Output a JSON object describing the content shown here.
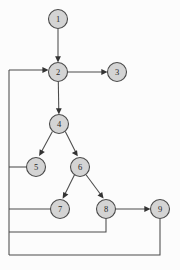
{
  "diagram": {
    "background_color": "#fcfcfc",
    "node_fill_color": "#d4d4d4",
    "node_stroke_color": "#4a4a4a",
    "edge_color": "#4a4a4a",
    "node_radius": 9.5,
    "nodes": [
      {
        "id": "1",
        "label": "1",
        "cx": 58,
        "cy": 19
      },
      {
        "id": "2",
        "label": "2",
        "cx": 58,
        "cy": 72
      },
      {
        "id": "3",
        "label": "3",
        "cx": 117,
        "cy": 72
      },
      {
        "id": "4",
        "label": "4",
        "cx": 59,
        "cy": 124
      },
      {
        "id": "5",
        "label": "5",
        "cx": 36,
        "cy": 167
      },
      {
        "id": "6",
        "label": "6",
        "cx": 80,
        "cy": 167
      },
      {
        "id": "7",
        "label": "7",
        "cx": 60,
        "cy": 209
      },
      {
        "id": "8",
        "label": "8",
        "cx": 106,
        "cy": 209
      },
      {
        "id": "9",
        "label": "9",
        "cx": 160,
        "cy": 209
      }
    ],
    "edges": [
      {
        "from": "1",
        "to": "2",
        "kind": "straight",
        "arrow": true
      },
      {
        "from": "2",
        "to": "3",
        "kind": "straight",
        "arrow": true
      },
      {
        "from": "2",
        "to": "4",
        "kind": "straight",
        "arrow": true
      },
      {
        "from": "4",
        "to": "5",
        "kind": "straight",
        "arrow": true
      },
      {
        "from": "4",
        "to": "6",
        "kind": "straight",
        "arrow": true
      },
      {
        "from": "6",
        "to": "7",
        "kind": "straight",
        "arrow": true
      },
      {
        "from": "6",
        "to": "8",
        "kind": "straight",
        "arrow": true
      },
      {
        "from": "8",
        "to": "9",
        "kind": "straight",
        "arrow": true
      },
      {
        "from": "5",
        "to": "2",
        "kind": "back-edge-left",
        "arrow": true
      },
      {
        "from": "7",
        "to": "2",
        "kind": "back-edge-left",
        "arrow": true
      },
      {
        "from": "8",
        "to": "2",
        "kind": "back-edge-left",
        "arrow": true
      },
      {
        "from": "9",
        "to": "2",
        "kind": "back-edge-left",
        "arrow": true
      }
    ],
    "back_edge_rail_x": 9,
    "back_edge_entry_y": 70,
    "back_edge_rows": [
      167,
      209,
      232,
      255
    ]
  }
}
